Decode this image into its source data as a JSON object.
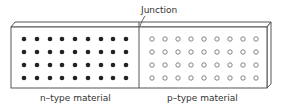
{
  "diagram": {
    "title_label": "Junction",
    "left_label": "n–type material",
    "right_label": "p–type material",
    "left_region": {
      "carrier": "filled-dot",
      "rows": 4,
      "cols": 9,
      "color": "#222222"
    },
    "right_region": {
      "carrier": "open-circle",
      "rows": 4,
      "cols": 9,
      "color": "#666666"
    }
  }
}
